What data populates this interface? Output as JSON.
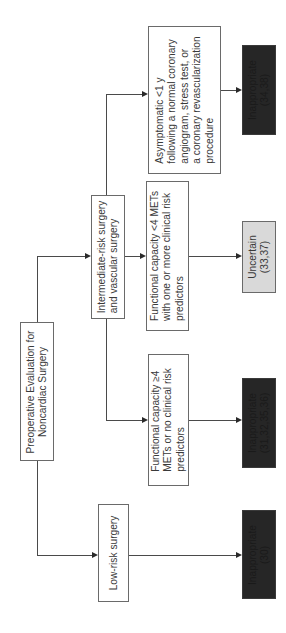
{
  "diagram": {
    "orientation": "rotated-90-ccw",
    "root": {
      "lines": [
        "Preoperative Evaluation for",
        "Noncardiac Surgery"
      ]
    },
    "branches": {
      "intermediate": {
        "lines": [
          "Intermediate-risk surgery",
          "and vascular surgery"
        ],
        "children": {
          "asymptomatic": {
            "lines": [
              "Asymptomatic <1 y",
              "following a normal coronary",
              "angiogram, stress test, or",
              "a coronary revascularization",
              "procedure"
            ],
            "outcome": {
              "lines": [
                "Inappropriate",
                "(34,38)"
              ],
              "rating": "Inappropriate",
              "color": "#262626"
            }
          },
          "low_capacity": {
            "lines": [
              "Functional capacity <4 METs",
              "with one or more clinical risk",
              "predictors"
            ],
            "outcome": {
              "lines": [
                "Uncertain",
                "(33,37)"
              ],
              "rating": "Uncertain",
              "color": "#d9d9d9"
            }
          },
          "high_capacity": {
            "lines": [
              "Functional capacity ≥4",
              "METs or no clinical risk",
              "predictors"
            ],
            "outcome": {
              "lines": [
                "Inappropriate",
                "(31,32,35,36)"
              ],
              "rating": "Inappropriate",
              "color": "#262626"
            }
          }
        }
      },
      "low_risk": {
        "lines": [
          "Low-risk surgery"
        ],
        "outcome": {
          "lines": [
            "Inappropriate",
            "(30)"
          ],
          "rating": "Inappropriate",
          "color": "#262626"
        }
      }
    },
    "colors": {
      "line": "#4a4a4a",
      "box_border": "#6a6a6a",
      "text": "#3a3a3a"
    }
  }
}
